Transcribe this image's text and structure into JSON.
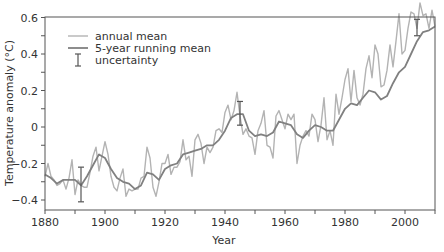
{
  "chart_data": {
    "type": "line",
    "title": "",
    "xlabel": "Year",
    "ylabel": "Temperature anomaly (°C)",
    "xlim": [
      1880,
      2010
    ],
    "ylim": [
      -0.45,
      0.6
    ],
    "x_ticks": [
      1880,
      1900,
      1920,
      1940,
      1960,
      1980,
      2000
    ],
    "x_tick_labels": [
      "1880",
      "1900",
      "1920",
      "1940",
      "1960",
      "1980",
      "2000"
    ],
    "y_ticks": [
      0.6,
      0.4,
      0.2,
      0,
      -0.2,
      -0.4
    ],
    "y_tick_labels": [
      "0.6",
      "0.4",
      "0.2",
      "0",
      "-0.2",
      "-0.4"
    ],
    "grid": false,
    "legend_position": "upper left",
    "legend": [
      {
        "label": "annual mean",
        "kind": "line",
        "color": "#b3b3b3"
      },
      {
        "label": "5-year running mean",
        "kind": "line",
        "color": "#808080"
      },
      {
        "label": "uncertainty",
        "kind": "errorbar",
        "color": "#555555"
      }
    ],
    "series": [
      {
        "name": "annual mean",
        "color": "#b3b3b3",
        "x": [
          1880,
          1881,
          1882,
          1883,
          1884,
          1885,
          1886,
          1887,
          1888,
          1889,
          1890,
          1891,
          1892,
          1893,
          1894,
          1895,
          1896,
          1897,
          1898,
          1899,
          1900,
          1901,
          1902,
          1903,
          1904,
          1905,
          1906,
          1907,
          1908,
          1909,
          1910,
          1911,
          1912,
          1913,
          1914,
          1915,
          1916,
          1917,
          1918,
          1919,
          1920,
          1921,
          1922,
          1923,
          1924,
          1925,
          1926,
          1927,
          1928,
          1929,
          1930,
          1931,
          1932,
          1933,
          1934,
          1935,
          1936,
          1937,
          1938,
          1939,
          1940,
          1941,
          1942,
          1943,
          1944,
          1945,
          1946,
          1947,
          1948,
          1949,
          1950,
          1951,
          1952,
          1953,
          1954,
          1955,
          1956,
          1957,
          1958,
          1959,
          1960,
          1961,
          1962,
          1963,
          1964,
          1965,
          1966,
          1967,
          1968,
          1969,
          1970,
          1971,
          1972,
          1973,
          1974,
          1975,
          1976,
          1977,
          1978,
          1979,
          1980,
          1981,
          1982,
          1983,
          1984,
          1985,
          1986,
          1987,
          1988,
          1989,
          1990,
          1991,
          1992,
          1993,
          1994,
          1995,
          1996,
          1997,
          1998,
          1999,
          2000,
          2001,
          2002,
          2003,
          2004,
          2005,
          2006,
          2007,
          2008,
          2009,
          2010
        ],
        "values": [
          -0.27,
          -0.2,
          -0.27,
          -0.29,
          -0.32,
          -0.31,
          -0.29,
          -0.34,
          -0.28,
          -0.18,
          -0.37,
          -0.29,
          -0.32,
          -0.33,
          -0.33,
          -0.25,
          -0.16,
          -0.11,
          -0.24,
          -0.16,
          -0.08,
          -0.15,
          -0.27,
          -0.33,
          -0.35,
          -0.28,
          -0.23,
          -0.38,
          -0.34,
          -0.35,
          -0.34,
          -0.34,
          -0.28,
          -0.27,
          -0.11,
          -0.17,
          -0.33,
          -0.38,
          -0.3,
          -0.2,
          -0.2,
          -0.15,
          -0.26,
          -0.22,
          -0.22,
          -0.19,
          -0.07,
          -0.18,
          -0.16,
          -0.27,
          -0.07,
          -0.04,
          -0.09,
          -0.2,
          -0.11,
          -0.14,
          -0.11,
          -0.02,
          -0.01,
          -0.03,
          0.08,
          0.12,
          0.04,
          0.09,
          0.19,
          0.06,
          -0.04,
          -0.01,
          -0.05,
          -0.06,
          -0.15,
          -0.02,
          0.02,
          0.09,
          -0.1,
          -0.11,
          -0.17,
          0.06,
          0.09,
          0.04,
          -0.01,
          0.07,
          0.04,
          0.07,
          -0.2,
          -0.1,
          -0.05,
          -0.02,
          -0.05,
          0.07,
          0.04,
          -0.08,
          0.01,
          0.16,
          -0.07,
          -0.02,
          -0.1,
          0.18,
          0.07,
          0.16,
          0.26,
          0.32,
          0.14,
          0.31,
          0.16,
          0.12,
          0.18,
          0.32,
          0.39,
          0.27,
          0.45,
          0.4,
          0.22,
          0.23,
          0.31,
          0.45,
          0.33,
          0.47,
          0.62,
          0.4,
          0.42,
          0.54,
          0.63,
          0.62,
          0.54,
          0.68,
          0.61,
          0.62,
          0.54,
          0.64,
          0.55
        ]
      },
      {
        "name": "5-year running mean",
        "color": "#808080",
        "x": [
          1880,
          1882,
          1884,
          1886,
          1888,
          1890,
          1892,
          1894,
          1896,
          1898,
          1900,
          1902,
          1904,
          1906,
          1908,
          1910,
          1912,
          1914,
          1916,
          1918,
          1920,
          1922,
          1924,
          1926,
          1928,
          1930,
          1932,
          1934,
          1936,
          1938,
          1940,
          1942,
          1944,
          1946,
          1948,
          1950,
          1952,
          1954,
          1956,
          1958,
          1960,
          1962,
          1964,
          1966,
          1968,
          1970,
          1972,
          1974,
          1976,
          1978,
          1980,
          1982,
          1984,
          1986,
          1988,
          1990,
          1992,
          1994,
          1996,
          1998,
          2000,
          2002,
          2004,
          2006,
          2008,
          2010
        ],
        "values": [
          -0.26,
          -0.28,
          -0.31,
          -0.29,
          -0.29,
          -0.29,
          -0.32,
          -0.27,
          -0.21,
          -0.15,
          -0.17,
          -0.23,
          -0.28,
          -0.3,
          -0.31,
          -0.34,
          -0.32,
          -0.25,
          -0.26,
          -0.29,
          -0.23,
          -0.21,
          -0.2,
          -0.15,
          -0.14,
          -0.13,
          -0.12,
          -0.1,
          -0.1,
          -0.07,
          -0.02,
          0.05,
          0.07,
          0.07,
          -0.02,
          -0.05,
          -0.04,
          -0.05,
          -0.03,
          0.03,
          0.02,
          0.01,
          -0.04,
          -0.06,
          -0.02,
          0.01,
          0.0,
          -0.02,
          -0.02,
          0.04,
          0.1,
          0.13,
          0.12,
          0.16,
          0.2,
          0.19,
          0.15,
          0.17,
          0.24,
          0.3,
          0.33,
          0.4,
          0.47,
          0.52,
          0.53,
          0.55
        ]
      }
    ],
    "error_bars": [
      {
        "year": 1892,
        "center": -0.32,
        "low": -0.41,
        "high": -0.22
      },
      {
        "year": 1945,
        "center": 0.06,
        "low": 0.01,
        "high": 0.14
      },
      {
        "year": 2004,
        "center": 0.53,
        "low": 0.5,
        "high": 0.59
      }
    ]
  }
}
